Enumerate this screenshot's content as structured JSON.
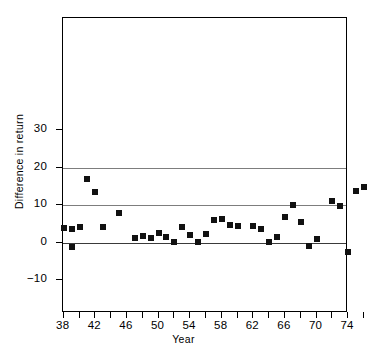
{
  "chart_data": {
    "type": "scatter",
    "title": "",
    "xlabel": "Year",
    "ylabel": "Difference in return",
    "xlim": [
      37,
      90
    ],
    "ylim": [
      -10,
      30
    ],
    "grid": true,
    "gridlines_y": [
      20,
      10,
      0
    ],
    "legend": null,
    "y_ticks": [
      30,
      20,
      10,
      0,
      -10
    ],
    "y_tick_labels": [
      "30",
      "20",
      "10",
      "0",
      "−10"
    ],
    "x_ticks": [
      38,
      40,
      42,
      44,
      46,
      48,
      50,
      52,
      54,
      56,
      58,
      60,
      62,
      64,
      66,
      68,
      70,
      72,
      74,
      76,
      78,
      80,
      82,
      84,
      86,
      88
    ],
    "x_tick_labels_major": [
      "38",
      "42",
      "46",
      "50",
      "54",
      "58",
      "62",
      "66",
      "70",
      "74",
      "78",
      "82",
      "88"
    ],
    "x_labeled_ticks": [
      38,
      42,
      46,
      50,
      54,
      58,
      62,
      66,
      70,
      74,
      78,
      82,
      88
    ],
    "marker": "filled-square",
    "marker_color": "#111111",
    "x": [
      38,
      39,
      40,
      41,
      42,
      43,
      45,
      47,
      48,
      49,
      50,
      51,
      52,
      53,
      54,
      55,
      56,
      57,
      58,
      59,
      60,
      61,
      62,
      63,
      64,
      65,
      67,
      68,
      69,
      70,
      72,
      74,
      75,
      76,
      78,
      79,
      80,
      82,
      83,
      85,
      86,
      88
    ],
    "y": [
      4.0,
      3.5,
      4.2,
      17.0,
      13.5,
      4.2,
      7.8,
      1.3,
      1.8,
      1.2,
      2.5,
      1.5,
      0.1,
      4.1,
      1.9,
      0.1,
      2.4,
      6.0,
      6.2,
      4.6,
      4.3,
      4.5,
      3.7,
      0.1,
      1.4,
      6.7,
      10.1,
      5.5,
      -0.9,
      0.9,
      11.2,
      9.7,
      -2.6,
      13.8,
      14.8,
      14.4,
      9.5,
      9.2,
      3.8,
      1.7,
      6.1,
      0.1,
      2.4,
      0.4,
      2.6,
      0.5,
      -4.5
    ],
    "points": [
      {
        "year": 38,
        "value": 4.0
      },
      {
        "year": 39,
        "value": 3.5
      },
      {
        "year": 39,
        "value": -1.2
      },
      {
        "year": 40,
        "value": 4.2
      },
      {
        "year": 41,
        "value": 17.0
      },
      {
        "year": 42,
        "value": 13.5
      },
      {
        "year": 43,
        "value": 4.2
      },
      {
        "year": 45,
        "value": 7.8
      },
      {
        "year": 47,
        "value": 1.3
      },
      {
        "year": 48,
        "value": 1.8
      },
      {
        "year": 49,
        "value": 1.2
      },
      {
        "year": 50,
        "value": 2.5
      },
      {
        "year": 51,
        "value": 1.5
      },
      {
        "year": 52,
        "value": 0.1
      },
      {
        "year": 53,
        "value": 4.1
      },
      {
        "year": 54,
        "value": 1.9
      },
      {
        "year": 55,
        "value": 0.1
      },
      {
        "year": 56,
        "value": 2.4
      },
      {
        "year": 57,
        "value": 6.0
      },
      {
        "year": 58,
        "value": 6.2
      },
      {
        "year": 59,
        "value": 4.6
      },
      {
        "year": 60,
        "value": 4.3
      },
      {
        "year": 62,
        "value": 4.5
      },
      {
        "year": 63,
        "value": 3.7
      },
      {
        "year": 64,
        "value": 0.1
      },
      {
        "year": 65,
        "value": 1.4
      },
      {
        "year": 66,
        "value": 6.7
      },
      {
        "year": 67,
        "value": 10.1
      },
      {
        "year": 68,
        "value": 5.5
      },
      {
        "year": 69,
        "value": -0.9
      },
      {
        "year": 70,
        "value": 0.9
      },
      {
        "year": 72,
        "value": 11.2
      },
      {
        "year": 73,
        "value": 9.7
      },
      {
        "year": 74,
        "value": -2.6
      },
      {
        "year": 75,
        "value": 13.8
      },
      {
        "year": 76,
        "value": 14.8
      },
      {
        "year": 77,
        "value": 14.4
      },
      {
        "year": 78,
        "value": 9.5
      },
      {
        "year": 79,
        "value": 9.2
      },
      {
        "year": 78,
        "value": 3.8
      },
      {
        "year": 80,
        "value": 1.7
      },
      {
        "year": 81,
        "value": 6.1
      },
      {
        "year": 82,
        "value": 0.1
      },
      {
        "year": 84,
        "value": 2.4
      },
      {
        "year": 85,
        "value": 0.4
      },
      {
        "year": 86,
        "value": 2.6
      },
      {
        "year": 87,
        "value": 0.5
      },
      {
        "year": 89,
        "value": -4.5
      }
    ]
  }
}
